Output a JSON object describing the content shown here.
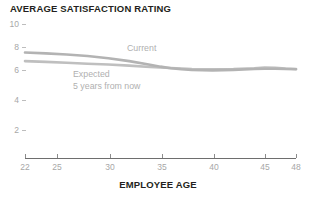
{
  "chart_data": {
    "type": "line",
    "title": "AVERAGE SATISFACTION RATING",
    "xlabel": "EMPLOYEE AGE",
    "ylabel": "",
    "xlim": [
      22,
      48
    ],
    "ylim": [
      0,
      10
    ],
    "grid": false,
    "legend_position": "inline-annotations",
    "x_ticks": [
      22,
      25,
      30,
      35,
      40,
      45,
      48
    ],
    "x_tick_labels": [
      "22",
      "25",
      "30",
      "35",
      "40",
      "45",
      "48"
    ],
    "y_ticks": [
      10,
      8,
      6,
      4,
      2
    ],
    "y_tick_labels": [
      "10",
      "8",
      "6",
      "4",
      "2"
    ],
    "x": [
      22,
      24,
      26,
      28,
      30,
      32,
      34,
      35,
      36,
      37,
      38,
      40,
      42,
      44,
      45,
      46,
      47,
      48
    ],
    "series": [
      {
        "name": "Current",
        "color": "#b3b3b3",
        "values": [
          7.85,
          7.78,
          7.7,
          7.58,
          7.42,
          7.2,
          6.92,
          6.78,
          6.66,
          6.58,
          6.53,
          6.5,
          6.54,
          6.6,
          6.62,
          6.62,
          6.6,
          6.58
        ]
      },
      {
        "name": "Expected",
        "color": "#bfbfbf",
        "values": [
          7.2,
          7.14,
          7.08,
          7.0,
          6.94,
          6.86,
          6.76,
          6.72,
          6.68,
          6.64,
          6.6,
          6.58,
          6.6,
          6.66,
          6.72,
          6.7,
          6.64,
          6.6
        ]
      }
    ],
    "annotations": [
      {
        "id": "current",
        "text": "Current",
        "x_px": 127,
        "y_px": 43
      },
      {
        "id": "expected",
        "line1": "Expected",
        "line2": "5 years from now",
        "x_px": 73,
        "y_px": 69
      }
    ]
  },
  "title": "AVERAGE SATISFACTION RATING",
  "axis": {
    "x_label": "EMPLOYEE AGE",
    "x_ticks": [
      {
        "label": "22",
        "px": 25
      },
      {
        "label": "25",
        "px": 57
      },
      {
        "label": "30",
        "px": 110
      },
      {
        "label": "35",
        "px": 162
      },
      {
        "label": "40",
        "px": 214
      },
      {
        "label": "45",
        "px": 265
      },
      {
        "label": "48",
        "px": 296
      }
    ],
    "y_ticks": [
      {
        "label": "10",
        "px": 24
      },
      {
        "label": "8",
        "px": 47
      },
      {
        "label": "6",
        "px": 70
      },
      {
        "label": "4",
        "px": 100
      },
      {
        "label": "2",
        "px": 130
      }
    ]
  },
  "legend": {
    "current": "Current",
    "expected_line1": "Expected",
    "expected_line2": "5 years from now"
  },
  "colors": {
    "title": "#231f20",
    "tick": "#a7a7a7",
    "axis_line": "#6e6e6e",
    "series_current": "#b3b3b3",
    "series_expected": "#bfbfbf",
    "annotation": "#b0b0b0"
  }
}
